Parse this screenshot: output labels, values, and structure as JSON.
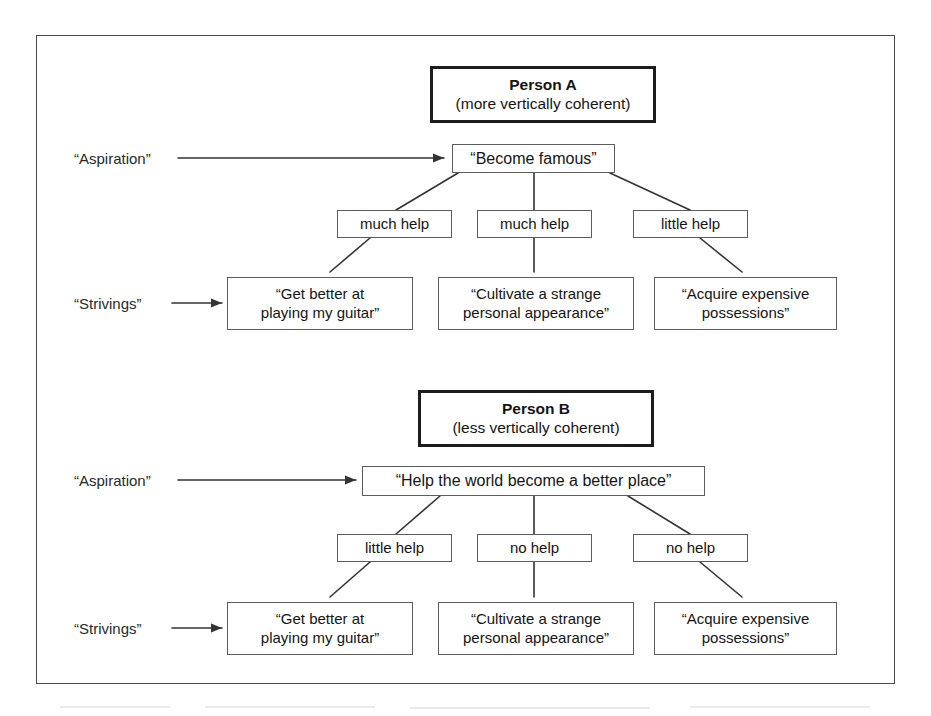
{
  "figure": {
    "caption_present": false,
    "frame_color": "#4a4a4a",
    "box_border_color": "#5c5c5c",
    "header_border_color": "#1c1c1c",
    "line_color": "#333333",
    "background": "#ffffff"
  },
  "row_labels": {
    "aspiration": "“Aspiration”",
    "strivings": "“Strivings”"
  },
  "persons": [
    {
      "id": "person-a",
      "title": "Person A",
      "subtitle": "(more vertically coherent)",
      "aspiration": "“Become famous”",
      "links": [
        {
          "label": "much help"
        },
        {
          "label": "much help"
        },
        {
          "label": "little help"
        }
      ],
      "strivings": [
        {
          "line1": "“Get better at",
          "line2": "playing my guitar”"
        },
        {
          "line1": "“Cultivate a strange",
          "line2": "personal appearance”"
        },
        {
          "line1": "“Acquire expensive",
          "line2": "possessions”"
        }
      ]
    },
    {
      "id": "person-b",
      "title": "Person B",
      "subtitle": "(less vertically coherent)",
      "aspiration": "“Help the world become a better place”",
      "links": [
        {
          "label": "little help"
        },
        {
          "label": "no help"
        },
        {
          "label": "no help"
        }
      ],
      "strivings": [
        {
          "line1": "“Get better at",
          "line2": "playing my guitar”"
        },
        {
          "line1": "“Cultivate a strange",
          "line2": "personal appearance”"
        },
        {
          "line1": "“Acquire expensive",
          "line2": "possessions”"
        }
      ]
    }
  ]
}
